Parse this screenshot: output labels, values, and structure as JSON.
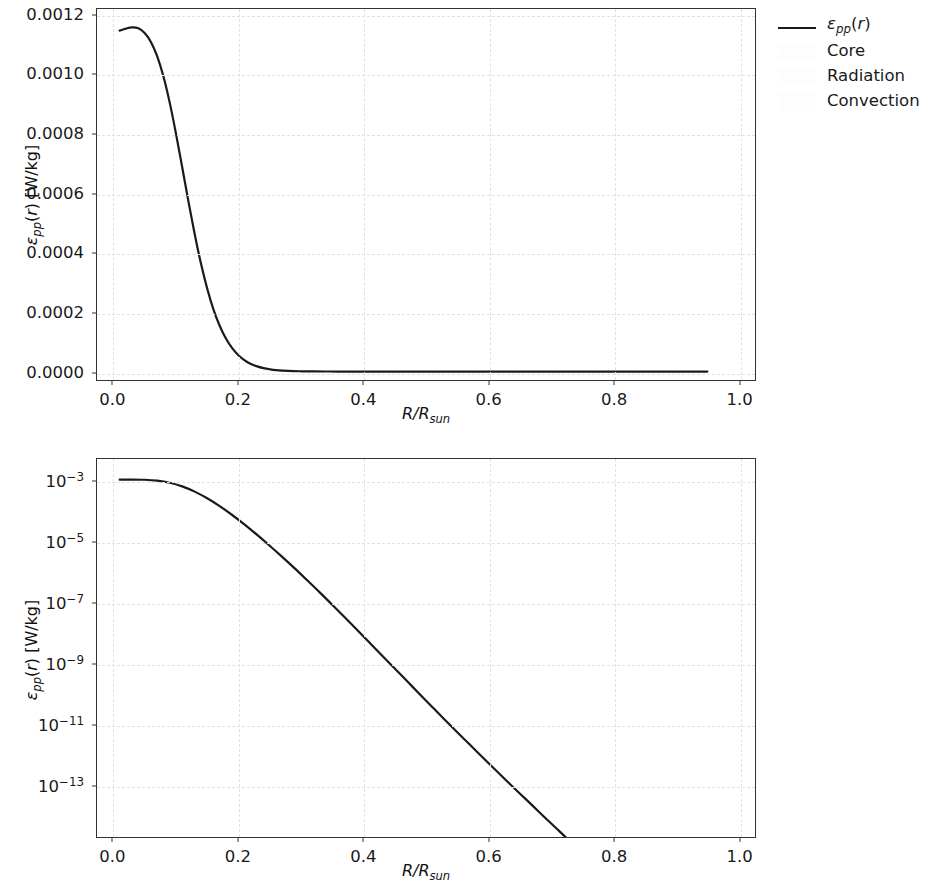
{
  "figure": {
    "width": 935,
    "height": 889,
    "background": "#ffffff",
    "line_color": "#1a1a1a",
    "grid_color": "#e2e2e2",
    "axis_color": "#333333"
  },
  "legend": {
    "position": "upper right outside",
    "entries": [
      {
        "label": "εpp(r)",
        "label_html": "<span class=\"mi\">ε</span><sub class=\"sm\">pp</sub>(<span class=\"mi\">r</span>)",
        "type": "line",
        "color": "#1a1a1a"
      },
      {
        "label": "Core",
        "label_html": "Core",
        "type": "patch",
        "color": "#fdfdfd"
      },
      {
        "label": "Radiation",
        "label_html": "Radiation",
        "type": "patch",
        "color": "#fdfdfd"
      },
      {
        "label": "Convection",
        "label_html": "Convection",
        "type": "patch",
        "color": "#fdfdfd"
      }
    ]
  },
  "chart_data": [
    {
      "id": "linear-panel",
      "type": "line",
      "title": "",
      "xlabel": "R/R_sun",
      "xlabel_html": "<span class=\"mi\">R</span>/<span class=\"mi\">R</span><sub class=\"sm\">sun</sub>",
      "ylabel": "εpp(r) [W/kg]",
      "ylabel_html": "<span class=\"mi\">ε</span><sub class=\"sm\">pp</sub>(<span class=\"mi\">r</span>) [W/kg]",
      "yscale": "linear",
      "xscale": "linear",
      "xlim": [
        -0.0262,
        1.0262
      ],
      "ylim": [
        -2.85e-05,
        0.001223
      ],
      "xticks": [
        0.0,
        0.2,
        0.4,
        0.6,
        0.8,
        1.0
      ],
      "xticklabels": [
        "0.0",
        "0.2",
        "0.4",
        "0.6",
        "0.8",
        "1.0"
      ],
      "yticks": [
        0.0,
        0.0002,
        0.0004,
        0.0006,
        0.0008,
        0.001,
        0.0012
      ],
      "yticklabels": [
        "0.0000",
        "0.0002",
        "0.0004",
        "0.0006",
        "0.0008",
        "0.0010",
        "0.0012"
      ],
      "grid": true,
      "series": [
        {
          "name": "εpp(r)",
          "color": "#1a1a1a",
          "x": [
            0.01,
            0.02,
            0.03,
            0.04,
            0.05,
            0.06,
            0.07,
            0.08,
            0.09,
            0.1,
            0.11,
            0.12,
            0.13,
            0.14,
            0.15,
            0.16,
            0.17,
            0.18,
            0.19,
            0.2,
            0.21,
            0.22,
            0.23,
            0.24,
            0.25,
            0.26,
            0.28,
            0.3,
            0.32,
            0.34,
            0.36,
            0.4,
            0.45,
            0.5,
            0.6,
            0.7,
            0.8,
            0.9,
            0.95
          ],
          "y": [
            0.00115,
            0.001157,
            0.001161,
            0.001158,
            0.001142,
            0.001112,
            0.001064,
            0.000996,
            0.000908,
            0.000804,
            0.00069,
            0.000574,
            0.000464,
            0.000365,
            0.00028,
            0.00021,
            0.0001545,
            0.0001115,
            7.9e-05,
            5.52e-05,
            3.8e-05,
            2.58e-05,
            1.74e-05,
            1.16e-05,
            7.7e-06,
            5.1e-06,
            2.2e-06,
            9.4e-07,
            4e-07,
            1.7e-07,
            7e-08,
            1.3e-08,
            1.5e-09,
            1.9e-10,
            4.8e-12,
            1.9e-13,
            8.5e-15,
            3e-16,
            2e-17
          ]
        }
      ]
    },
    {
      "id": "log-panel",
      "type": "line",
      "title": "",
      "xlabel": "R/R_sun",
      "xlabel_html": "<span class=\"mi\">R</span>/<span class=\"mi\">R</span><sub class=\"sm\">sun</sub>",
      "ylabel": "εpp(r) [W/kg]",
      "ylabel_html": "<span class=\"mi\">ε</span><sub class=\"sm\">pp</sub>(<span class=\"mi\">r</span>) [W/kg]",
      "yscale": "log",
      "xscale": "linear",
      "xlim": [
        -0.0262,
        1.0262
      ],
      "ylim": [
        2e-15,
        0.0055
      ],
      "xticks": [
        0.0,
        0.2,
        0.4,
        0.6,
        0.8,
        1.0
      ],
      "xticklabels": [
        "0.0",
        "0.2",
        "0.4",
        "0.6",
        "0.8",
        "1.0"
      ],
      "yticks": [
        0.001,
        1e-05,
        1e-07,
        1e-09,
        1e-11,
        1e-13
      ],
      "yticklabels": [
        "10−3",
        "10−5",
        "10−7",
        "10−9",
        "10−11",
        "10−13"
      ],
      "ytick_exponents": [
        -3,
        -5,
        -7,
        -9,
        -11,
        -13
      ],
      "grid": true,
      "series": [
        {
          "name": "εpp(r)",
          "color": "#1a1a1a",
          "x": [
            0.01,
            0.03,
            0.05,
            0.07,
            0.09,
            0.11,
            0.13,
            0.15,
            0.17,
            0.19,
            0.21,
            0.23,
            0.25,
            0.27,
            0.29,
            0.31,
            0.33,
            0.35,
            0.37,
            0.39,
            0.41,
            0.43,
            0.45,
            0.47,
            0.49,
            0.51,
            0.53,
            0.55,
            0.57,
            0.59,
            0.61,
            0.63,
            0.65,
            0.67,
            0.69,
            0.71,
            0.73,
            0.75,
            0.77,
            0.79,
            0.81,
            0.83,
            0.85,
            0.87,
            0.89,
            0.91,
            0.93,
            0.95
          ],
          "y": [
            0.00115,
            0.001161,
            0.001142,
            0.001064,
            0.000908,
            0.00069,
            0.000464,
            0.00028,
            0.0001545,
            7.9e-05,
            3.8e-05,
            1.74e-05,
            7.7e-06,
            3.3e-06,
            1.38e-06,
            5.6e-07,
            2.25e-07,
            8.8e-08,
            3.4e-08,
            1.3e-08,
            4.9e-09,
            1.85e-09,
            7e-10,
            2.65e-10,
            1e-10,
            3.8e-11,
            1.45e-11,
            5.6e-12,
            2.2e-12,
            8.6e-13,
            3.4e-13,
            1.35e-13,
            5.4e-14,
            2.2e-14,
            8.8e-15,
            3.6e-15,
            1.45e-15,
            5.6e-16,
            2.1e-16,
            7.5e-17,
            2.5e-17,
            7.6e-18,
            2.05e-18,
            4.8e-19,
            9.5e-20,
            1.5e-20,
            1.8e-21,
            1.4e-22
          ]
        }
      ]
    }
  ]
}
